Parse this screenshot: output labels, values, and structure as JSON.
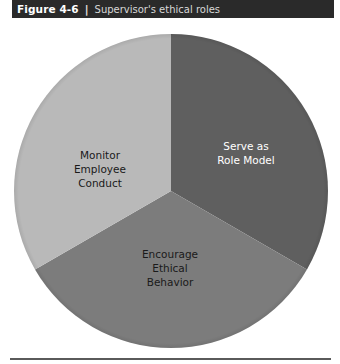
{
  "header": {
    "figure_label": "Figure 4-6",
    "separator": "|",
    "title": "Supervisor's ethical roles"
  },
  "chart_data": {
    "type": "pie",
    "title": "Supervisor's ethical roles",
    "figure_number": "Figure 4-6",
    "categories": [
      "Serve as Role Model",
      "Encourage Ethical Behavior",
      "Monitor Employee Conduct"
    ],
    "values": [
      33.3,
      33.3,
      33.3
    ],
    "colors": [
      "#5f5f5f",
      "#7c7c7c",
      "#b9b9b9"
    ],
    "label_colors": [
      "#ffffff",
      "#1a1a1a",
      "#1a1a1a"
    ],
    "start_angle_deg": 0,
    "direction": "clockwise",
    "legend": "none (labels inside slices)",
    "labels": {
      "serve": [
        "Serve as",
        "Role Model"
      ],
      "encourage": [
        "Encourage",
        "Ethical",
        "Behavior"
      ],
      "monitor": [
        "Monitor",
        "Employee",
        "Conduct"
      ]
    }
  }
}
